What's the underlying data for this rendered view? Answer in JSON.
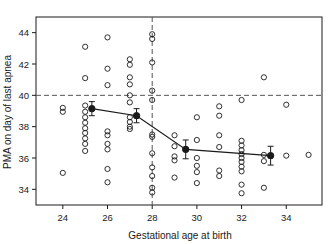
{
  "chart_data": {
    "type": "scatter",
    "title": "",
    "xlabel": "Gestational age at birth",
    "ylabel": "PMA on day of last apnea",
    "xlim": [
      22.8,
      35.6
    ],
    "ylim": [
      33.0,
      45.0
    ],
    "xticks": [
      24,
      26,
      28,
      30,
      32,
      34
    ],
    "yticks": [
      34,
      36,
      38,
      40,
      42,
      44
    ],
    "grid": false,
    "legend": "none",
    "annotations": [
      {
        "name": "reference-line-pma-40",
        "type": "hline",
        "y": 40,
        "style": "dashed"
      },
      {
        "name": "reference-line-ga-28",
        "type": "vline",
        "x": 28,
        "style": "dashed"
      }
    ],
    "series": [
      {
        "name": "Individual infants",
        "marker": "open-circle",
        "points": [
          [
            24.0,
            39.2
          ],
          [
            24.0,
            38.95
          ],
          [
            24.0,
            35.05
          ],
          [
            25.0,
            43.1
          ],
          [
            25.0,
            41.1
          ],
          [
            25.0,
            39.35
          ],
          [
            25.0,
            38.95
          ],
          [
            25.0,
            38.6
          ],
          [
            25.0,
            38.25
          ],
          [
            25.0,
            37.9
          ],
          [
            25.0,
            37.6
          ],
          [
            25.0,
            37.25
          ],
          [
            25.0,
            36.9
          ],
          [
            25.0,
            36.45
          ],
          [
            26.0,
            43.7
          ],
          [
            26.0,
            41.7
          ],
          [
            26.0,
            40.65
          ],
          [
            26.0,
            37.7
          ],
          [
            26.0,
            37.45
          ],
          [
            26.0,
            36.9
          ],
          [
            26.0,
            36.55
          ],
          [
            26.0,
            35.3
          ],
          [
            26.0,
            34.45
          ],
          [
            27.0,
            42.3
          ],
          [
            27.0,
            41.95
          ],
          [
            27.0,
            41.15
          ],
          [
            27.0,
            40.7
          ],
          [
            27.0,
            40.0
          ],
          [
            27.0,
            39.55
          ],
          [
            27.0,
            38.6
          ],
          [
            27.0,
            38.3
          ],
          [
            27.0,
            38.0
          ],
          [
            27.0,
            37.85
          ],
          [
            28.0,
            43.9
          ],
          [
            28.0,
            43.6
          ],
          [
            28.0,
            42.1
          ],
          [
            28.0,
            40.3
          ],
          [
            28.0,
            39.7
          ],
          [
            28.0,
            37.5
          ],
          [
            28.0,
            37.35
          ],
          [
            28.0,
            36.3
          ],
          [
            28.0,
            35.4
          ],
          [
            28.0,
            34.85
          ],
          [
            28.0,
            34.1
          ],
          [
            28.0,
            33.8
          ],
          [
            29.0,
            37.45
          ],
          [
            29.0,
            36.75
          ],
          [
            29.0,
            36.1
          ],
          [
            29.0,
            35.85
          ],
          [
            29.0,
            34.75
          ],
          [
            30.0,
            38.6
          ],
          [
            30.0,
            37.15
          ],
          [
            30.0,
            36.0
          ],
          [
            30.0,
            35.5
          ],
          [
            30.0,
            35.1
          ],
          [
            30.0,
            34.4
          ],
          [
            31.0,
            39.3
          ],
          [
            31.0,
            38.7
          ],
          [
            31.0,
            37.45
          ],
          [
            31.0,
            36.7
          ],
          [
            31.0,
            35.2
          ],
          [
            31.0,
            34.85
          ],
          [
            32.0,
            39.7
          ],
          [
            32.0,
            37.1
          ],
          [
            32.0,
            36.8
          ],
          [
            32.0,
            36.5
          ],
          [
            32.0,
            36.25
          ],
          [
            32.0,
            36.0
          ],
          [
            32.0,
            35.75
          ],
          [
            32.0,
            35.45
          ],
          [
            32.0,
            35.15
          ],
          [
            32.0,
            34.3
          ],
          [
            32.0,
            33.75
          ],
          [
            33.0,
            41.15
          ],
          [
            33.0,
            36.2
          ],
          [
            33.0,
            35.8
          ],
          [
            33.0,
            34.1
          ],
          [
            34.0,
            39.4
          ],
          [
            34.0,
            36.15
          ],
          [
            35.0,
            36.2
          ]
        ]
      },
      {
        "name": "Group means with error bars",
        "marker": "filled-circle",
        "line": "solid",
        "points": [
          {
            "x": 25.3,
            "y": 39.15,
            "err": 0.45
          },
          {
            "x": 27.3,
            "y": 38.7,
            "err": 0.45
          },
          {
            "x": 29.5,
            "y": 36.55,
            "err": 0.6
          },
          {
            "x": 33.3,
            "y": 36.15,
            "err": 0.6
          }
        ]
      }
    ]
  },
  "colors": {
    "axis": "#1a1a1a",
    "marker": "#1a1a1a",
    "reference_line": "#555555",
    "background": "#ffffff"
  }
}
